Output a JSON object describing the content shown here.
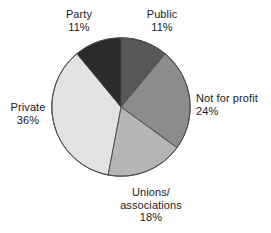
{
  "chart_data": {
    "type": "pie",
    "title": "",
    "subtitle": "",
    "xlabel": "",
    "ylabel": "",
    "grid": false,
    "legend_position": "none",
    "label_format": "name + percent",
    "start_angle_deg": 0,
    "direction": "clockwise",
    "units": "percent",
    "total": 100,
    "categories": [
      "Public",
      "Not for profit",
      "Unions/associations",
      "Private",
      "Party"
    ],
    "values": [
      11,
      24,
      18,
      36,
      11
    ],
    "slices": [
      {
        "name": "Public",
        "label_line1": "Public",
        "label_line2": "11%",
        "value": 11,
        "percent_text": "11%",
        "color": "#585858",
        "start_deg": 0,
        "end_deg": 39.6
      },
      {
        "name": "Not for profit",
        "label_line1": "Not for profit",
        "label_line2": "24%",
        "value": 24,
        "percent_text": "24%",
        "color": "#8c8c8c",
        "start_deg": 39.6,
        "end_deg": 126.0
      },
      {
        "name": "Unions/associations",
        "label_line1": "Unions/",
        "label_line1b": "associations",
        "label_line2": "18%",
        "value": 18,
        "percent_text": "18%",
        "color": "#b5b5b5",
        "start_deg": 126.0,
        "end_deg": 190.8
      },
      {
        "name": "Private",
        "label_line1": "Private",
        "label_line2": "36%",
        "value": 36,
        "percent_text": "36%",
        "color": "#e3e3e3",
        "start_deg": 190.8,
        "end_deg": 320.4
      },
      {
        "name": "Party",
        "label_line1": "Party",
        "label_line2": "11%",
        "value": 11,
        "percent_text": "11%",
        "color": "#2b2b2b",
        "start_deg": 320.4,
        "end_deg": 360.0
      }
    ],
    "outline_color": "#4d4d4d",
    "background_color": "#ffffff",
    "text_color": "#1a1a1a"
  }
}
